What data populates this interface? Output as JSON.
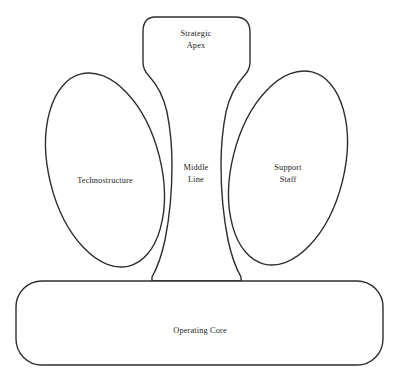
{
  "diagram": {
    "type": "organizational-structure",
    "background_color": "#ffffff",
    "line_color": "#2e2e2e",
    "text_color": "#1c1c1c",
    "parts": [
      {
        "id": "strategic-apex",
        "label_line1": "Strategic",
        "label_line2": "Apex",
        "shape": "rounded-rectangle",
        "position": "top-center"
      },
      {
        "id": "middle-line",
        "label_line1": "Middle",
        "label_line2": "Line",
        "shape": "vertical-band",
        "position": "center"
      },
      {
        "id": "technostructure",
        "label_line1": "Technostructure",
        "label_line2": "",
        "shape": "tilted-ellipse",
        "position": "left"
      },
      {
        "id": "support-staff",
        "label_line1": "Support",
        "label_line2": "Staff",
        "shape": "tilted-ellipse",
        "position": "right"
      },
      {
        "id": "operating-core",
        "label_line1": "Operating Core",
        "label_line2": "",
        "shape": "rounded-rectangle",
        "position": "bottom"
      }
    ]
  }
}
